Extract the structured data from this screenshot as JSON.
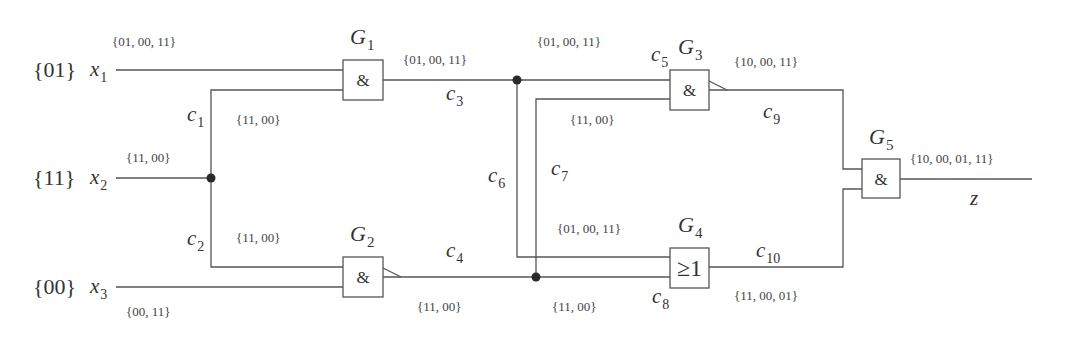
{
  "inputs": {
    "x1": {
      "name": "x",
      "sub": "1",
      "value": "{01}",
      "set": "{01, 00, 11}"
    },
    "x2": {
      "name": "x",
      "sub": "2",
      "value": "{11}",
      "set": "{11, 00}"
    },
    "x3": {
      "name": "x",
      "sub": "3",
      "value": "{00}",
      "set": "{00, 11}"
    }
  },
  "gates": {
    "G1": {
      "name": "G",
      "sub": "1",
      "symbol": "&"
    },
    "G2": {
      "name": "G",
      "sub": "2",
      "symbol": "&"
    },
    "G3": {
      "name": "G",
      "sub": "3",
      "symbol": "&"
    },
    "G4": {
      "name": "G",
      "sub": "4",
      "symbol": "≥1"
    },
    "G5": {
      "name": "G",
      "sub": "5",
      "symbol": "&"
    }
  },
  "connections": {
    "c1": {
      "name": "c",
      "sub": "1",
      "set": "{11, 00}"
    },
    "c2": {
      "name": "c",
      "sub": "2",
      "set": "{11, 00}"
    },
    "c3": {
      "name": "c",
      "sub": "3",
      "set": "{01, 00, 11}"
    },
    "c4": {
      "name": "c",
      "sub": "4",
      "set": "{11, 00}"
    },
    "c5": {
      "name": "c",
      "sub": "5",
      "set": "{01, 00, 11}"
    },
    "c6": {
      "name": "c",
      "sub": "6",
      "set": "{01, 00, 11}"
    },
    "c7": {
      "name": "c",
      "sub": "7",
      "set": "{11, 00}"
    },
    "c8": {
      "name": "c",
      "sub": "8",
      "set": "{11, 00}"
    },
    "c9": {
      "name": "c",
      "sub": "9",
      "set": "{10, 00, 11}"
    },
    "c10": {
      "name": "c",
      "sub": "10",
      "set": "{11, 00, 01}"
    }
  },
  "output": {
    "name": "z",
    "set": "{10, 00, 01, 11}"
  },
  "colors": {
    "line": "#555555",
    "text": "#333333",
    "dot": "#2a2a2a"
  }
}
